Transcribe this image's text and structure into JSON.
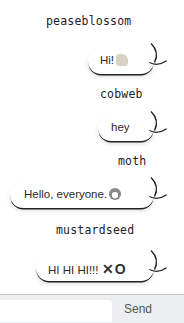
{
  "messages": [
    {
      "user": "peaseblossom",
      "text": "Hi!",
      "emoji": "waving-hand"
    },
    {
      "user": "cobweb",
      "text": "hey",
      "emoji": ""
    },
    {
      "user": "moth",
      "text": "Hello, everyone.",
      "emoji": "grinning-face"
    },
    {
      "user": "mustardseed",
      "text": "HI HI HI!!! ",
      "emoji": "xo"
    }
  ],
  "composer": {
    "input_value": "",
    "send_label": "Send"
  },
  "emoji_glyphs": {
    "xo": "✕O"
  },
  "colors": {
    "background": "#ffffff",
    "footer": "#eceeef",
    "text": "#2a2a2a",
    "bubble_shadow": "#222222"
  }
}
